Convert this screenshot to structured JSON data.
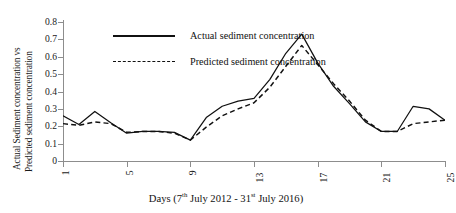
{
  "chart_data": {
    "type": "line",
    "title": "",
    "xlabel": "Days (7th July 2012 - 31st July 2016)",
    "xlabel_parts": {
      "prefix": "Days (7",
      "sup1": "th",
      "mid": " July 2012 - 31",
      "sup2": "st",
      "suffix": " July 2016)"
    },
    "ylabel_line1": "Actual Sediment concentration vs",
    "ylabel_line2": "Predicted sediment concentration",
    "x": [
      1,
      2,
      3,
      4,
      5,
      6,
      7,
      8,
      9,
      10,
      11,
      12,
      13,
      14,
      15,
      16,
      17,
      18,
      19,
      20,
      21,
      22,
      23,
      24,
      25
    ],
    "xlim": [
      1,
      25
    ],
    "ylim": [
      0,
      0.8
    ],
    "xticks": [
      1,
      5,
      9,
      13,
      17,
      21,
      25
    ],
    "xticklabels": [
      "1",
      "5",
      "9",
      "13",
      "17",
      "21",
      "25"
    ],
    "yticks": [
      0,
      0.1,
      0.2,
      0.3,
      0.4,
      0.5,
      0.6,
      0.7,
      0.8
    ],
    "yticklabels": [
      "0",
      "0.1",
      "0.2",
      "0.3",
      "0.4",
      "0.5",
      "0.6",
      "0.7",
      "0.8"
    ],
    "grid": false,
    "legend_position": "upper-center",
    "series": [
      {
        "name": "Actual sediment concentration",
        "style": "solid",
        "color": "#111111",
        "values": [
          0.26,
          0.21,
          0.285,
          0.22,
          0.16,
          0.17,
          0.17,
          0.165,
          0.12,
          0.25,
          0.315,
          0.345,
          0.36,
          0.47,
          0.62,
          0.73,
          0.565,
          0.43,
          0.33,
          0.225,
          0.17,
          0.17,
          0.315,
          0.3,
          0.235
        ]
      },
      {
        "name": "Predicted sediment concentration",
        "style": "dashed",
        "color": "#111111",
        "values": [
          0.215,
          0.205,
          0.225,
          0.215,
          0.165,
          0.17,
          0.17,
          0.16,
          0.12,
          0.195,
          0.26,
          0.3,
          0.335,
          0.425,
          0.545,
          0.665,
          0.555,
          0.445,
          0.345,
          0.235,
          0.17,
          0.17,
          0.215,
          0.225,
          0.235
        ]
      }
    ]
  },
  "legend": {
    "entries": [
      {
        "label": "Actual sediment concentration",
        "style": "solid"
      },
      {
        "label": "Predicted sediment concentration",
        "style": "dashed"
      }
    ]
  },
  "colors": {
    "axis": "#8d8d8d",
    "ink": "#111111",
    "background": "#ffffff"
  }
}
